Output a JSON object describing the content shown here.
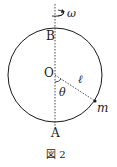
{
  "figure": {
    "caption": "図 2",
    "labels": {
      "top_point": "B",
      "center": "O",
      "bottom_point": "A",
      "length": "ℓ",
      "angle": "θ",
      "mass": "m",
      "angular_velocity": "ω"
    },
    "geometry": {
      "circle_center": [
        55,
        75
      ],
      "circle_radius": 47,
      "axis_x": 55,
      "mass_position": [
        95,
        102
      ]
    },
    "colors": {
      "stroke": "#1a1a1a",
      "background": "#ffffff"
    }
  }
}
